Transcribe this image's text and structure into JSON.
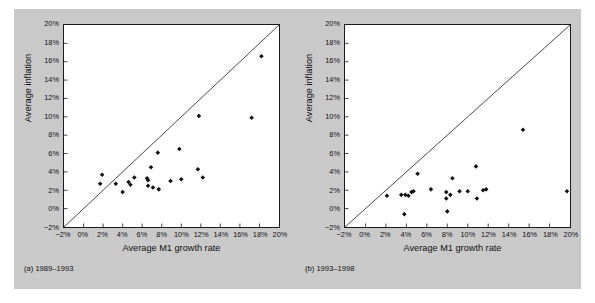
{
  "figure": {
    "background_color": "#c9c9c9",
    "plot_background_color": "#ffffff",
    "axis_color": "#1a1a1a",
    "marker_color": "#111111"
  },
  "panels": [
    {
      "id": "a",
      "caption_letter": "(a)",
      "caption_period": "1989–1993",
      "caption_full": "(a) 1989–1993"
    },
    {
      "id": "b",
      "caption_letter": "(b)",
      "caption_period": "1993–1998",
      "caption_full": "(b) 1993–1998"
    }
  ],
  "chart_data": [
    {
      "type": "scatter",
      "title": "",
      "panel_label": "(a) 1989–1993",
      "xlabel": "Average M1 growth rate",
      "ylabel": "Average inflation",
      "xlim": [
        -2,
        20
      ],
      "ylim": [
        -2,
        20
      ],
      "xticks": [
        -2,
        0,
        2,
        4,
        6,
        8,
        10,
        12,
        14,
        16,
        18,
        20
      ],
      "yticks": [
        -2,
        0,
        2,
        4,
        6,
        8,
        10,
        12,
        14,
        16,
        18,
        20
      ],
      "xticklabels": [
        "−2%",
        "0%",
        "2%",
        "4%",
        "6%",
        "8%",
        "10%",
        "12%",
        "14%",
        "16%",
        "18%",
        "20%"
      ],
      "yticklabels": [
        "−2%",
        "0%",
        "2%",
        "4%",
        "6%",
        "8%",
        "10%",
        "12%",
        "14%",
        "16%",
        "18%",
        "20%"
      ],
      "grid": false,
      "legend": null,
      "reference_line": {
        "name": "45-degree line",
        "from": [
          -2,
          -2
        ],
        "to": [
          20,
          20
        ]
      },
      "points": [
        {
          "x": 1.7,
          "y": 2.7
        },
        {
          "x": 1.9,
          "y": 3.7
        },
        {
          "x": 3.3,
          "y": 2.7
        },
        {
          "x": 4.0,
          "y": 1.8
        },
        {
          "x": 4.6,
          "y": 2.9
        },
        {
          "x": 4.8,
          "y": 2.6
        },
        {
          "x": 5.2,
          "y": 3.4
        },
        {
          "x": 6.5,
          "y": 3.3
        },
        {
          "x": 6.6,
          "y": 3.1
        },
        {
          "x": 6.6,
          "y": 2.5
        },
        {
          "x": 6.9,
          "y": 4.5
        },
        {
          "x": 7.1,
          "y": 2.3
        },
        {
          "x": 7.6,
          "y": 6.1
        },
        {
          "x": 7.7,
          "y": 2.1
        },
        {
          "x": 8.9,
          "y": 3.0
        },
        {
          "x": 9.8,
          "y": 6.5
        },
        {
          "x": 10.0,
          "y": 3.2
        },
        {
          "x": 11.7,
          "y": 4.3
        },
        {
          "x": 11.8,
          "y": 10.1
        },
        {
          "x": 12.2,
          "y": 3.4
        },
        {
          "x": 17.2,
          "y": 9.9
        },
        {
          "x": 18.2,
          "y": 16.6
        }
      ]
    },
    {
      "type": "scatter",
      "title": "",
      "panel_label": "(b) 1993–1998",
      "xlabel": "Average M1 growth rate",
      "ylabel": "Average inflation",
      "xlim": [
        -2,
        20
      ],
      "ylim": [
        -2,
        20
      ],
      "xticks": [
        -2,
        0,
        2,
        4,
        6,
        8,
        10,
        12,
        14,
        16,
        18,
        20
      ],
      "yticks": [
        -2,
        0,
        2,
        4,
        6,
        8,
        10,
        12,
        14,
        16,
        18,
        20
      ],
      "xticklabels": [
        "−2%",
        "0%",
        "2%",
        "4%",
        "6%",
        "8%",
        "10%",
        "12%",
        "14%",
        "16%",
        "18%",
        "20%"
      ],
      "yticklabels": [
        "−2%",
        "0%",
        "2%",
        "4%",
        "6%",
        "8%",
        "10%",
        "12%",
        "14%",
        "16%",
        "18%",
        "20%"
      ],
      "grid": false,
      "legend": null,
      "reference_line": {
        "name": "45-degree line",
        "from": [
          -2,
          -2
        ],
        "to": [
          20,
          20
        ]
      },
      "points": [
        {
          "x": 2.1,
          "y": 1.4
        },
        {
          "x": 3.5,
          "y": 1.5
        },
        {
          "x": 3.8,
          "y": -0.6
        },
        {
          "x": 3.9,
          "y": 1.5
        },
        {
          "x": 4.2,
          "y": 1.4
        },
        {
          "x": 4.5,
          "y": 1.8
        },
        {
          "x": 4.7,
          "y": 1.9
        },
        {
          "x": 5.1,
          "y": 3.8
        },
        {
          "x": 6.4,
          "y": 2.1
        },
        {
          "x": 7.9,
          "y": 1.8
        },
        {
          "x": 7.9,
          "y": 1.1
        },
        {
          "x": 8.0,
          "y": -0.3
        },
        {
          "x": 8.3,
          "y": 1.5
        },
        {
          "x": 8.5,
          "y": 3.3
        },
        {
          "x": 9.2,
          "y": 1.9
        },
        {
          "x": 10.0,
          "y": 1.9
        },
        {
          "x": 10.8,
          "y": 4.6
        },
        {
          "x": 10.9,
          "y": 1.1
        },
        {
          "x": 11.5,
          "y": 2.0
        },
        {
          "x": 11.8,
          "y": 2.1
        },
        {
          "x": 15.4,
          "y": 8.6
        },
        {
          "x": 19.7,
          "y": 1.9
        }
      ]
    }
  ]
}
